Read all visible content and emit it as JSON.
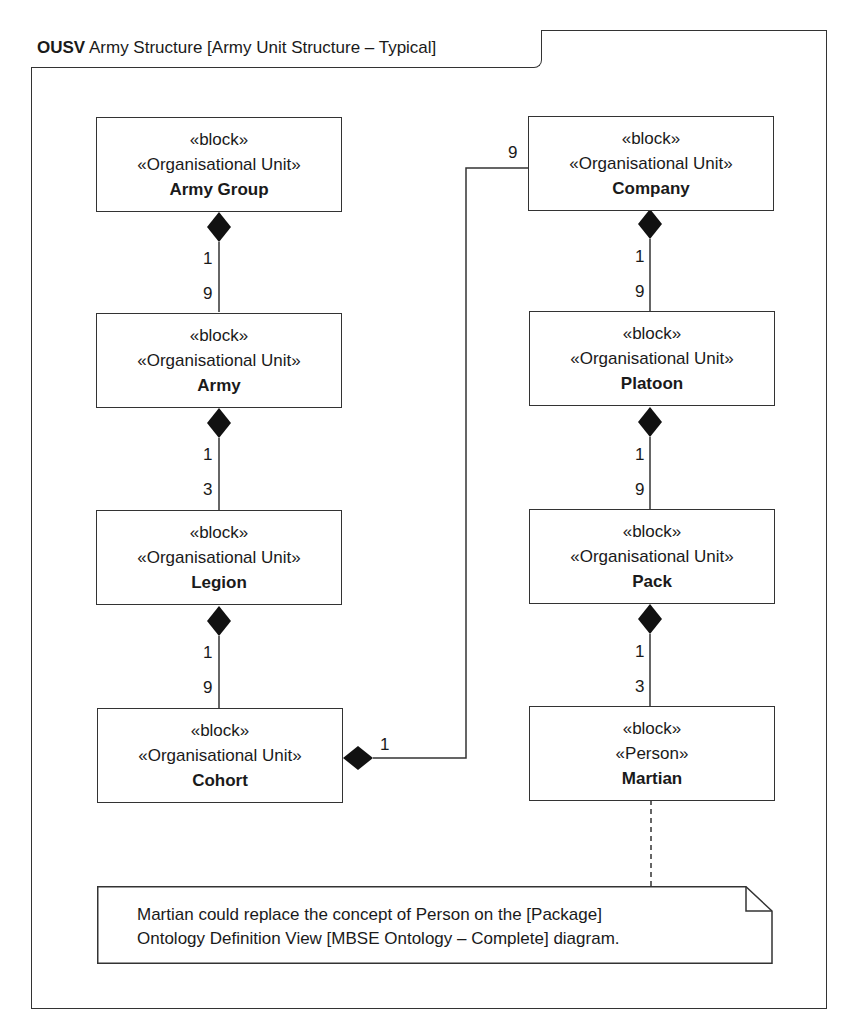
{
  "frame": {
    "kind": "OUSV",
    "title": "Army Structure [Army Unit Structure – Typical]"
  },
  "blocks": [
    {
      "id": "army-group",
      "stereotype1": "«block»",
      "stereotype2": "«Organisational Unit»",
      "name": "Army Group"
    },
    {
      "id": "army",
      "stereotype1": "«block»",
      "stereotype2": "«Organisational Unit»",
      "name": "Army"
    },
    {
      "id": "legion",
      "stereotype1": "«block»",
      "stereotype2": "«Organisational Unit»",
      "name": "Legion"
    },
    {
      "id": "cohort",
      "stereotype1": "«block»",
      "stereotype2": "«Organisational Unit»",
      "name": "Cohort"
    },
    {
      "id": "company",
      "stereotype1": "«block»",
      "stereotype2": "«Organisational Unit»",
      "name": "Company"
    },
    {
      "id": "platoon",
      "stereotype1": "«block»",
      "stereotype2": "«Organisational Unit»",
      "name": "Platoon"
    },
    {
      "id": "pack",
      "stereotype1": "«block»",
      "stereotype2": "«Organisational Unit»",
      "name": "Pack"
    },
    {
      "id": "martian",
      "stereotype1": "«block»",
      "stereotype2": "«Person»",
      "name": "Martian"
    }
  ],
  "compositions": [
    {
      "whole": "Army Group",
      "part": "Army",
      "whole_mult": "1",
      "part_mult": "9"
    },
    {
      "whole": "Army",
      "part": "Legion",
      "whole_mult": "1",
      "part_mult": "3"
    },
    {
      "whole": "Legion",
      "part": "Cohort",
      "whole_mult": "1",
      "part_mult": "9"
    },
    {
      "whole": "Cohort",
      "part": "Company",
      "whole_mult": "1",
      "part_mult": "9"
    },
    {
      "whole": "Company",
      "part": "Platoon",
      "whole_mult": "1",
      "part_mult": "9"
    },
    {
      "whole": "Platoon",
      "part": "Pack",
      "whole_mult": "1",
      "part_mult": "9"
    },
    {
      "whole": "Pack",
      "part": "Martian",
      "whole_mult": "1",
      "part_mult": "3"
    }
  ],
  "note": {
    "line1": "Martian could replace the concept of Person on the [Package]",
    "line2": "Ontology Definition View [MBSE Ontology – Complete] diagram."
  },
  "colors": {
    "line": "#333333",
    "fill": "#ffffff",
    "diamond": "#111111"
  }
}
